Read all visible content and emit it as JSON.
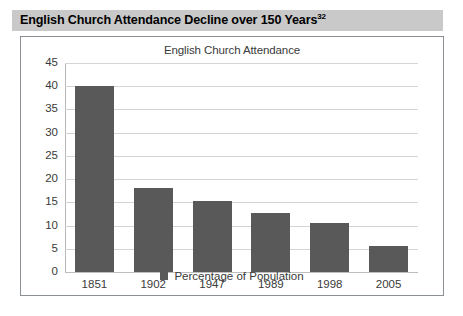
{
  "figure": {
    "heading": "English Church Attendance Decline over 150 Years",
    "heading_footnote": "32",
    "heading_background": "#c9c9c9",
    "frame_border_color": "#8a8f96"
  },
  "chart_data": {
    "type": "bar",
    "title": "English Church Attendance",
    "xlabel": "",
    "ylabel": "",
    "categories": [
      "1851",
      "1902",
      "1947",
      "1989",
      "1998",
      "2005"
    ],
    "series": [
      {
        "name": "Percentage of Population",
        "color": "#595959",
        "values": [
          40,
          18,
          15.2,
          12.6,
          10.5,
          5.5
        ]
      }
    ],
    "yticks": [
      0,
      5,
      10,
      15,
      20,
      25,
      30,
      35,
      40,
      45
    ],
    "ylim": [
      0,
      45
    ],
    "grid": true,
    "grid_color": "#d4d4d4",
    "legend": {
      "position": "bottom",
      "entries": [
        "Percentage of Population"
      ]
    }
  }
}
